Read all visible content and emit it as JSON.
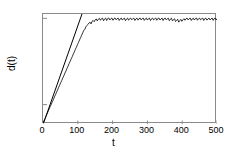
{
  "chart_data": {
    "type": "line",
    "title": "",
    "xlabel": "t",
    "ylabel": "d(t)",
    "yscale": "log",
    "xlim": [
      0,
      500
    ],
    "ylim_exp": [
      -24.5,
      1.0
    ],
    "grid": false,
    "legend": false,
    "xticks": [
      0,
      100,
      200,
      300,
      400,
      500
    ],
    "xticklabels": [
      "0",
      "100",
      "200",
      "300",
      "400",
      "500"
    ],
    "yticks_exp": [
      0,
      -20
    ],
    "yticklabels": [
      {
        "mantissa": "10",
        "exponent": "0"
      },
      {
        "mantissa": "10",
        "exponent": "-20"
      }
    ],
    "series": [
      {
        "name": "d(t)",
        "style": "solid-thin-black",
        "color": "#000000",
        "comment": "log10 of divergence versus time: exponential growth then saturation with oscillation",
        "x": [
          0,
          3,
          6,
          9,
          12,
          15,
          18,
          21,
          24,
          27,
          30,
          33,
          36,
          39,
          42,
          45,
          48,
          51,
          54,
          57,
          60,
          63,
          66,
          69,
          72,
          75,
          78,
          81,
          84,
          87,
          90,
          93,
          96,
          99,
          102,
          105,
          108,
          111,
          114,
          117,
          120,
          123,
          126,
          129,
          132,
          135,
          138,
          141,
          144,
          147,
          150,
          153,
          156,
          159,
          162,
          165,
          168,
          171,
          174,
          177,
          180,
          183,
          186,
          189,
          192,
          195,
          198,
          201,
          204,
          207,
          210,
          213,
          216,
          219,
          222,
          225,
          228,
          231,
          234,
          237,
          240,
          243,
          246,
          249,
          252,
          255,
          258,
          261,
          264,
          267,
          270,
          273,
          276,
          279,
          282,
          285,
          288,
          291,
          294,
          297,
          300,
          303,
          306,
          309,
          312,
          315,
          318,
          321,
          324,
          327,
          330,
          333,
          336,
          339,
          342,
          345,
          348,
          351,
          354,
          357,
          360,
          363,
          366,
          369,
          372,
          375,
          378,
          381,
          384,
          387,
          390,
          393,
          396,
          399,
          402,
          405,
          408,
          411,
          414,
          417,
          420,
          423,
          426,
          429,
          432,
          435,
          438,
          441,
          444,
          447,
          450,
          453,
          456,
          459,
          462,
          465,
          468,
          471,
          474,
          477,
          480,
          483,
          486,
          489,
          492,
          495,
          498,
          500
        ],
        "y_log10": [
          -24.3,
          -23.7,
          -23.2,
          -22.6,
          -22.1,
          -21.5,
          -21.0,
          -20.4,
          -19.9,
          -19.3,
          -18.8,
          -18.2,
          -17.7,
          -17.1,
          -16.6,
          -16.0,
          -15.5,
          -14.9,
          -14.4,
          -13.8,
          -13.3,
          -12.7,
          -12.2,
          -11.6,
          -11.1,
          -10.5,
          -10.0,
          -9.4,
          -8.9,
          -8.3,
          -7.8,
          -7.2,
          -6.7,
          -6.1,
          -5.6,
          -5.0,
          -4.5,
          -3.9,
          -3.4,
          -2.8,
          -2.6,
          -2.0,
          -1.7,
          -1.4,
          -1.1,
          -0.9,
          -1.3,
          -0.7,
          -0.5,
          -0.8,
          -0.35,
          -0.15,
          -0.6,
          -0.2,
          0.0,
          -0.45,
          -0.1,
          0.05,
          -0.55,
          -0.15,
          0.05,
          -0.5,
          -0.05,
          0.08,
          -0.4,
          -0.1,
          0.06,
          -0.45,
          -0.05,
          0.07,
          -0.35,
          -0.08,
          0.05,
          -0.5,
          -0.12,
          0.06,
          -0.4,
          -0.1,
          0.04,
          -0.55,
          -0.15,
          0.05,
          -0.45,
          -0.08,
          0.06,
          -0.35,
          -0.1,
          0.05,
          -0.5,
          -0.12,
          0.04,
          -0.42,
          -0.06,
          0.07,
          -0.38,
          -0.1,
          0.05,
          -0.48,
          -0.14,
          0.06,
          -0.4,
          -0.08,
          0.05,
          -0.52,
          -0.1,
          0.04,
          -0.36,
          -0.12,
          0.06,
          -0.46,
          -0.05,
          0.07,
          -0.4,
          -0.15,
          0.05,
          -0.5,
          -0.08,
          0.06,
          -0.34,
          -0.12,
          0.04,
          -0.55,
          -0.18,
          0.03,
          -0.6,
          -0.3,
          -0.1,
          -0.75,
          -0.5,
          -0.2,
          -0.9,
          -0.55,
          -0.25,
          -0.7,
          -0.35,
          -0.08,
          -0.45,
          -0.12,
          0.05,
          -0.38,
          -0.1,
          0.06,
          -0.5,
          -0.14,
          0.04,
          -0.4,
          -0.06,
          0.07,
          -0.45,
          -0.1,
          0.05,
          -0.35,
          -0.12,
          0.06,
          -0.5,
          -0.08,
          0.04,
          -0.42,
          -0.15,
          0.05,
          -0.38,
          -0.1,
          0.07,
          -0.48,
          -0.06,
          0.05,
          -0.4,
          -0.12,
          0.06,
          -0.3,
          0.02
        ]
      },
      {
        "name": "exponential-fit-line",
        "style": "straight-reference-line",
        "color": "#000000",
        "x": [
          2,
          112
        ],
        "y_log10": [
          -24.2,
          1.0
        ]
      }
    ]
  },
  "axes": {
    "xlabel": "t",
    "ylabel": "d(t)"
  }
}
